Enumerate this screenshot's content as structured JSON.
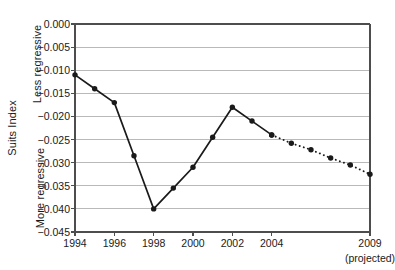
{
  "chart_data": {
    "type": "line",
    "title": "",
    "xlabel": "",
    "ylabel": "Suits Index",
    "ylabel_top": "Less regressive",
    "ylabel_bottom": "More regressive",
    "ylim": [
      -0.045,
      0.0
    ],
    "ytick_values": [
      0.0,
      -0.005,
      -0.01,
      -0.015,
      -0.02,
      -0.025,
      -0.03,
      -0.035,
      -0.04,
      -0.045
    ],
    "ytick_labels": [
      "0.000",
      "−0.005",
      "−0.010",
      "−0.015",
      "−0.020",
      "−0.025",
      "−0.030",
      "−0.035",
      "−0.040",
      "−0.045"
    ],
    "xlim": [
      1994,
      2009
    ],
    "xtick_values": [
      1994,
      1996,
      1998,
      2000,
      2002,
      2004,
      2009
    ],
    "xtick_labels": [
      "1994",
      "1996",
      "1998",
      "2000",
      "2002",
      "2004",
      "2009"
    ],
    "x_axis_note": "(projected)",
    "x_axis_note_at": 2009,
    "grid": "horizontal",
    "legend": "none",
    "series": [
      {
        "name": "Suits Index (actual)",
        "style": "solid",
        "x": [
          1994,
          1995,
          1996,
          1997,
          1998,
          1999,
          2000,
          2001,
          2002,
          2003,
          2004
        ],
        "values": [
          -0.011,
          -0.014,
          -0.017,
          -0.0285,
          -0.04,
          -0.0355,
          -0.031,
          -0.0245,
          -0.018,
          -0.021,
          -0.024
        ]
      },
      {
        "name": "Suits Index (projected)",
        "style": "dotted",
        "x": [
          2004,
          2005,
          2006,
          2007,
          2008,
          2009
        ],
        "values": [
          -0.024,
          -0.0258,
          -0.0272,
          -0.029,
          -0.0305,
          -0.0325
        ]
      }
    ]
  },
  "colors": {
    "line": "#1a1a1a",
    "marker": "#1a1a1a",
    "grid": "#b9b9b9",
    "axis": "#4d4d4d",
    "text": "#1a1a1a",
    "background": "#ffffff"
  }
}
